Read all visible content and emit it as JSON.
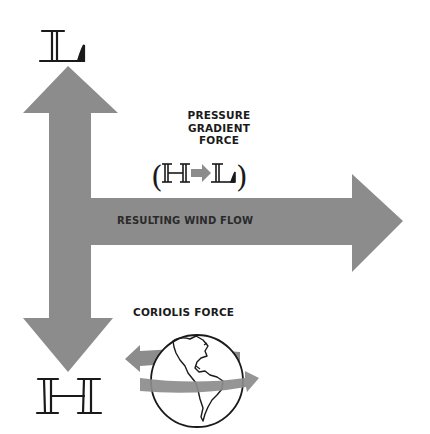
{
  "diagram": {
    "nodes": {
      "low_pressure": {
        "symbol": "L",
        "position": "top"
      },
      "high_pressure": {
        "symbol": "H",
        "position": "bottom"
      }
    },
    "labels": {
      "pressure_gradient_line1": "PRESSURE",
      "pressure_gradient_line2": "GRADIENT",
      "pressure_gradient_line3": "FORCE",
      "pressure_gradient_formula_open": "(",
      "pressure_gradient_formula_from": "H",
      "pressure_gradient_formula_to": "L",
      "pressure_gradient_formula_close": ")",
      "resulting_wind": "RESULTING WIND FLOW",
      "coriolis": "CORIOLIS FORCE"
    },
    "arrows": [
      {
        "name": "pressure-gradient-arrow",
        "direction": "up",
        "target": "L"
      },
      {
        "name": "coriolis-arrow",
        "direction": "down",
        "target": "H"
      },
      {
        "name": "wind-flow-arrow",
        "direction": "right"
      }
    ],
    "colors": {
      "arrow_fill": "#8c8c8c",
      "ink": "#1a1a1a",
      "background": "#ffffff"
    }
  }
}
